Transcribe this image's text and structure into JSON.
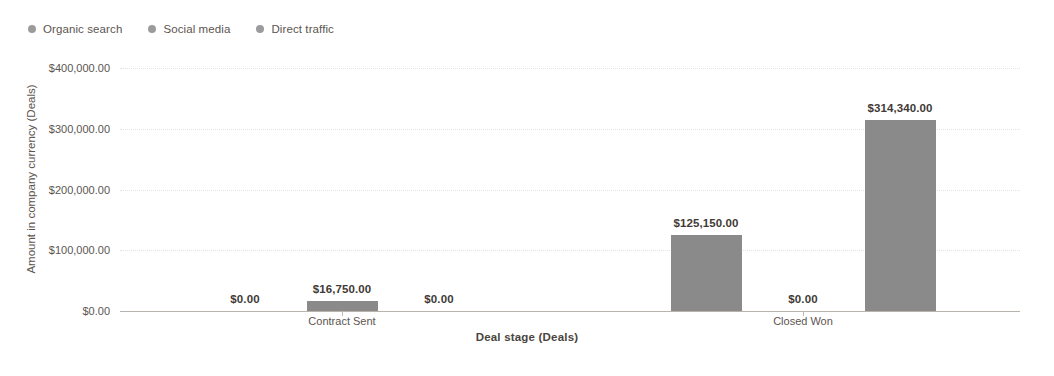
{
  "chart_data": {
    "type": "bar",
    "title": "",
    "categories": [
      "Contract Sent",
      "Closed Won"
    ],
    "series": [
      {
        "name": "Organic search",
        "values": [
          0,
          125150
        ],
        "color": "#8a8a8a"
      },
      {
        "name": "Social media",
        "values": [
          16750,
          0
        ],
        "color": "#8a8a8a"
      },
      {
        "name": "Direct traffic",
        "values": [
          0,
          314340
        ],
        "color": "#8a8a8a"
      }
    ],
    "data_labels": [
      [
        "$0.00",
        "$16,750.00",
        "$0.00"
      ],
      [
        "$125,150.00",
        "$0.00",
        "$314,340.00"
      ]
    ],
    "xlabel": "Deal stage (Deals)",
    "ylabel": "Amount in company currency (Deals)",
    "ylim": [
      0,
      400000
    ],
    "yticks": [
      0,
      100000,
      200000,
      300000,
      400000
    ],
    "ytick_labels": [
      "$0.00",
      "$100,000.00",
      "$200,000.00",
      "$300,000.00",
      "$400,000.00"
    ],
    "grid": true,
    "legend_position": "top-left"
  },
  "legend": {
    "items": [
      {
        "label": "Organic search",
        "marker": "legend-dot-icon"
      },
      {
        "label": "Social media",
        "marker": "legend-dot-icon"
      },
      {
        "label": "Direct traffic",
        "marker": "legend-dot-icon"
      }
    ]
  },
  "axes": {
    "x_title": "Deal stage (Deals)",
    "y_title": "Amount in company currency (Deals)"
  },
  "colors": {
    "bar_fill": "#8a8a8a",
    "grid": "#e6e2de",
    "axis_line": "#b9b3ad",
    "text": "#5c5550",
    "label_text": "#3f3a36",
    "background": "#ffffff"
  }
}
